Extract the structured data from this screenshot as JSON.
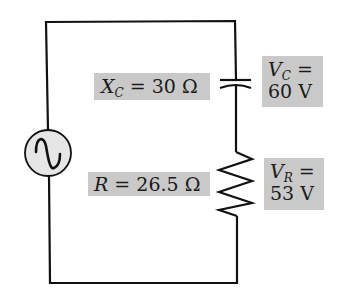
{
  "diagram": {
    "type": "series RC circuit",
    "source": {
      "kind": "AC voltage source",
      "symbol": "sine-wave"
    },
    "capacitor": {
      "reactance_symbol": "X",
      "reactance_subscript": "C",
      "reactance_eq": " = 30 Ω",
      "voltage_symbol": "V",
      "voltage_subscript": "C",
      "voltage_eq": " =",
      "voltage_value": "60 V"
    },
    "resistor": {
      "resistance_symbol": "R",
      "resistance_eq": " = 26.5 Ω",
      "voltage_symbol": "V",
      "voltage_subscript": "R",
      "voltage_eq": " =",
      "voltage_value": "53 V"
    },
    "colors": {
      "wire": "#111111",
      "label_background": "#c9c9c9",
      "source_fill": "#e6e6e6"
    }
  }
}
